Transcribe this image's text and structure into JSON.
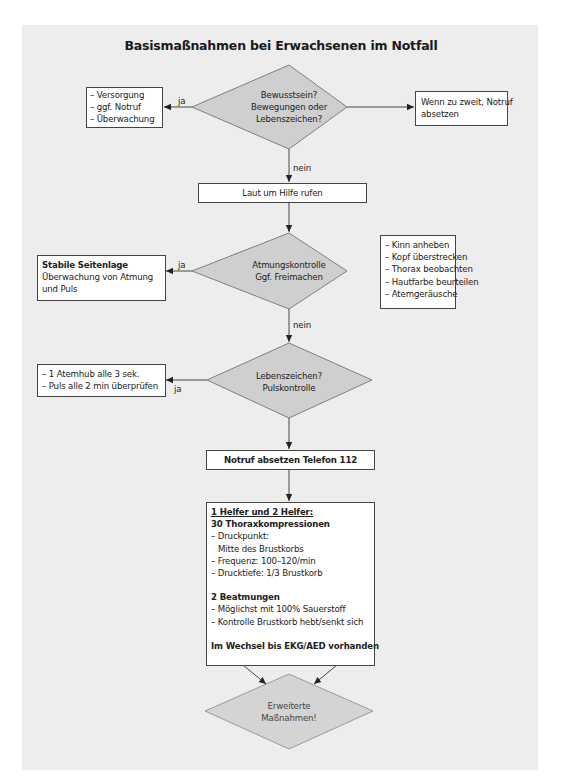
{
  "title": "Basismaßnahmen bei Erwachsenen im Notfall",
  "colors": {
    "panel_background": "#ededed",
    "diamond_fill": "#cfcfcf",
    "box_fill": "#ffffff",
    "stroke": "#444444"
  },
  "decision_1": {
    "lines": [
      "Bewusstsein?",
      "Bewegungen oder",
      "Lebenszeichen?"
    ]
  },
  "box_ja_1": {
    "items": [
      "– Versorgung",
      "– ggf. Notruf",
      "– Überwachung"
    ]
  },
  "box_right_1": {
    "lines": [
      "Wenn zu zweit, Notruf",
      "absetzen"
    ]
  },
  "edge_labels": {
    "ja_1": "ja",
    "nein_1": "nein",
    "ja_2": "ja",
    "nein_2": "nein",
    "ja_3": "ja"
  },
  "step_call_help": "Laut um Hilfe rufen",
  "decision_2": {
    "lines": [
      "Atmungskontrolle",
      "Ggf. Freimachen"
    ]
  },
  "box_ja_2": {
    "heading": "Stabile Seitenlage",
    "lines": [
      "Überwachung von Atmung",
      "und Puls"
    ]
  },
  "box_right_2": {
    "items": [
      "– Kinn anheben",
      "– Kopf überstrecken",
      "– Thorax beobachten",
      "– Hautfarbe beurteilen",
      "– Atemgeräusche"
    ]
  },
  "decision_3": {
    "lines": [
      "Lebenszeichen?",
      "Pulskontrolle"
    ]
  },
  "box_ja_3": {
    "items": [
      "– 1 Atemhub alle 3 sek.",
      "– Puls alle 2 min überprüfen"
    ]
  },
  "step_emergency_call": "Notruf absetzen Telefon 112",
  "cpr_box": {
    "heading": "1 Helfer und 2 Helfer:",
    "compressions_title": "30 Thoraxkompressionen",
    "compressions": [
      "– Druckpunkt:",
      "Mitte des Brustkorbs",
      "– Frequenz: 100–120/min",
      "– Drucktiefe: 1/3 Brustkorb"
    ],
    "ventilation_title": "2 Beatmungen",
    "ventilation": [
      "– Möglichst mit 100% Sauerstoff",
      "– Kontrolle Brustkorb hebt/senkt sich"
    ],
    "footer": "Im Wechsel bis EKG/AED vorhanden"
  },
  "decision_final": {
    "lines": [
      "Erweiterte",
      "Maßnahmen!"
    ]
  }
}
